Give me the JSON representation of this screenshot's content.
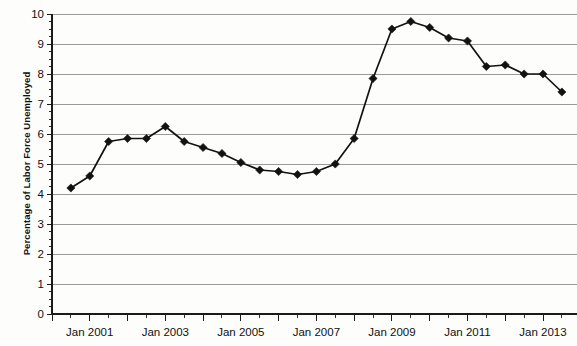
{
  "chart_data": {
    "type": "line",
    "title": "",
    "xlabel": "",
    "ylabel": "Percentage of Labor Force Unemployed",
    "ylim": [
      0,
      10
    ],
    "ytick_values": [
      0,
      1,
      2,
      3,
      4,
      5,
      6,
      7,
      8,
      9,
      10
    ],
    "ytick_labels": [
      "0",
      "1",
      "2",
      "3",
      "4",
      "5",
      "6",
      "7",
      "8",
      "9",
      "10"
    ],
    "y_minor_ticks": true,
    "grid": "horizontal",
    "legend": "none",
    "xtick_labels": [
      "Jan 2001",
      "Jan 2003",
      "Jan 2005",
      "Jan 2007",
      "Jan 2009",
      "Jan 2011",
      "Jan 2013"
    ],
    "x_label_positions": [
      2001,
      2003,
      2005,
      2007,
      2009,
      2011,
      2013
    ],
    "xlim": [
      2000.0,
      2013.9
    ],
    "x_major_tick_interval_years": 1,
    "x_minor_tick_interval_years": 0.5,
    "marker": "diamond",
    "line_color": "#121212",
    "grid_color": "#9a9a9a",
    "x": [
      2000.5,
      2001.0,
      2001.5,
      2002.0,
      2002.5,
      2003.0,
      2003.5,
      2004.0,
      2004.5,
      2005.0,
      2005.5,
      2006.0,
      2006.5,
      2007.0,
      2007.5,
      2008.0,
      2008.5,
      2009.0,
      2009.5,
      2010.0,
      2010.5,
      2011.0,
      2011.5,
      2012.0,
      2012.5,
      2013.0,
      2013.5
    ],
    "x_point_labels": [
      "Jul 2000",
      "Jan 2001",
      "Jul 2001",
      "Jan 2002",
      "Jul 2002",
      "Jan 2003",
      "Jul 2003",
      "Jan 2004",
      "Jul 2004",
      "Jan 2005",
      "Jul 2005",
      "Jan 2006",
      "Jul 2006",
      "Jan 2007",
      "Jul 2007",
      "Jan 2008",
      "Jul 2008",
      "Jan 2009",
      "Jul 2009",
      "Jan 2010",
      "Jul 2010",
      "Jan 2011",
      "Jul 2011",
      "Jan 2012",
      "Jul 2012",
      "Jan 2013",
      "Jul 2013"
    ],
    "values": [
      4.2,
      4.6,
      5.75,
      5.85,
      5.85,
      6.25,
      5.75,
      5.55,
      5.35,
      5.05,
      4.8,
      4.75,
      4.65,
      4.75,
      5.0,
      5.85,
      7.85,
      9.5,
      9.75,
      9.55,
      9.2,
      9.1,
      8.25,
      8.3,
      8.0,
      8.0,
      7.4
    ],
    "series": [
      {
        "name": "Unemployment rate",
        "values": [
          4.2,
          4.6,
          5.75,
          5.85,
          5.85,
          6.25,
          5.75,
          5.55,
          5.35,
          5.05,
          4.8,
          4.75,
          4.65,
          4.75,
          5.0,
          5.85,
          7.85,
          9.5,
          9.75,
          9.55,
          9.2,
          9.1,
          8.25,
          8.3,
          8.0,
          8.0,
          7.4
        ]
      }
    ]
  },
  "axis": {
    "y_title": "Percentage of Labor Force Unemployed"
  }
}
